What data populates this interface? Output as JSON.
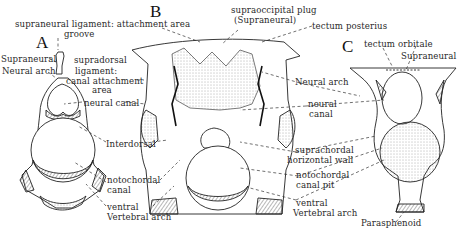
{
  "figure": {
    "panels": {
      "A": "A",
      "B": "B",
      "C": "C"
    },
    "labels_top": {
      "supraneural_ligament": "supraneural ligament: attachment area",
      "groove": "groove",
      "supraoccipital_plug_1": "supraoccipital plug",
      "supraoccipital_plug_2": "(Supraneural)",
      "tectum_posterius": "tectum posterius"
    },
    "panel_a": {
      "supraneural": "Supraneural",
      "neural_arch": "Neural arch",
      "supradorsal_1": "supradorsal",
      "supradorsal_2": "ligament:",
      "supradorsal_3": "canal attachment",
      "supradorsal_4": "area",
      "neural_canal": "neural canal",
      "interdorsal": "Interdorsal",
      "notochordal_1": "notochordal",
      "notochordal_2": "canal",
      "ventral_1": "ventral",
      "ventral_2": "Vertebral arch"
    },
    "panel_b": {
      "neural_arch": "Neural arch",
      "neural_canal_1": "neural",
      "neural_canal_2": "canal",
      "suprachordal_1": "suprachordal",
      "suprachordal_2": "horizontal wall",
      "notochordal_pit_1": "notochordal",
      "notochordal_pit_2": "canal pit",
      "ventral_1": "ventral",
      "ventral_2": "Vertebral arch"
    },
    "panel_c": {
      "tectum_orbitale": "tectum orbitale",
      "supraneural": "Supraneural",
      "parasphenoid": "Parasphenoid"
    },
    "colors": {
      "ink": "#222222",
      "background": "#ffffff"
    }
  }
}
